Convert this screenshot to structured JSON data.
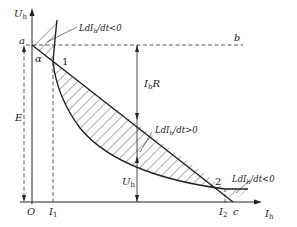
{
  "diagram": {
    "type": "arc volt-ampere characteristic with load line",
    "axes": {
      "y_label": "U",
      "y_label_sub": "h",
      "x_label": "I",
      "x_label_sub": "h",
      "origin_label": "O"
    },
    "points": {
      "a": "a",
      "b": "b",
      "c": "c",
      "p1": "1",
      "p2": "2"
    },
    "angle_label": "α",
    "current_ticks": [
      {
        "label": "I",
        "sub": "1"
      },
      {
        "label": "I",
        "sub": "2"
      }
    ],
    "dimension_labels": {
      "E": "E",
      "IhR_main": "I",
      "IhR_sub": "h",
      "IhR_tail": "R",
      "Uh_main": "U",
      "Uh_sub": "h"
    },
    "annotations": [
      {
        "id": "top",
        "pre": "LdI",
        "sub": "h",
        "post": "/dt<0"
      },
      {
        "id": "middle",
        "pre": "LdI",
        "sub": "h",
        "post": "/dt>0"
      },
      {
        "id": "right",
        "pre": "LdI",
        "sub": "h",
        "post": "/dt<0"
      }
    ],
    "colors": {
      "line": "#222222",
      "background": "#ffffff"
    }
  }
}
